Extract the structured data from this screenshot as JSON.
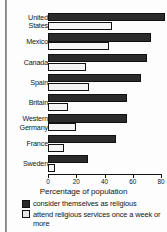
{
  "chart_data": {
    "type": "bar",
    "orientation": "horizontal",
    "title": "",
    "xlabel": "Percentage of population",
    "ylabel": "",
    "xlim": [
      0,
      80
    ],
    "xticks": [
      0,
      20,
      40,
      60,
      80
    ],
    "xtick_labels": [
      "0",
      "20",
      "40",
      "60",
      "80"
    ],
    "grid": false,
    "legend_position": "bottom-left",
    "categories": [
      "United\nStates",
      "Mexico",
      "Canada",
      "Spain",
      "Britain",
      "Western\nGermany",
      "France",
      "Sweden"
    ],
    "series": [
      {
        "name": "consider themselves as religious",
        "color": "#2b2b2b",
        "values": [
          83,
          73,
          70,
          66,
          56,
          56,
          48,
          28
        ]
      },
      {
        "name": "attend religious services once a week or more",
        "color": "#f4f4f4",
        "values": [
          45,
          43,
          27,
          29,
          14,
          20,
          11,
          5
        ]
      }
    ]
  },
  "legend": {
    "items": [
      {
        "label": "consider themselves as religious",
        "swatch": "dark"
      },
      {
        "label": "attend religious services once a week or more",
        "swatch": "light"
      }
    ]
  },
  "axis": {
    "title": "Percentage of population"
  }
}
